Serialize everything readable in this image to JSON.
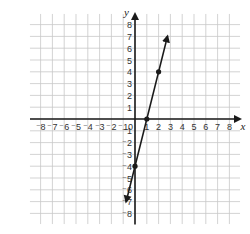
{
  "chart_data": {
    "type": "line",
    "title": "",
    "xlabel": "x",
    "ylabel": "y",
    "xlim": [
      -8,
      8
    ],
    "ylim": [
      -8,
      8
    ],
    "grid": true,
    "x_ticks": [
      -8,
      -7,
      -6,
      -5,
      -4,
      -3,
      -2,
      -1,
      0,
      1,
      2,
      3,
      4,
      5,
      6,
      7,
      8
    ],
    "y_ticks": [
      -8,
      -7,
      -6,
      -5,
      -4,
      -3,
      -2,
      -1,
      1,
      2,
      3,
      4,
      5,
      6,
      7,
      8
    ],
    "origin_label": "0",
    "series": [
      {
        "name": "y = 4x - 4",
        "equation": "y = 4x - 4",
        "slope": 4,
        "intercept": -4,
        "points": [
          [
            0,
            -4
          ],
          [
            1,
            0
          ],
          [
            2,
            4
          ]
        ],
        "line_extent": [
          [
            -0.75,
            -7
          ],
          [
            2.75,
            7
          ]
        ],
        "arrows": "both",
        "color": "#1a1a1a"
      }
    ]
  },
  "colors": {
    "grid": "#c8c8c8",
    "axis": "#1a1a1a",
    "line": "#1a1a1a",
    "background": "#ffffff"
  }
}
